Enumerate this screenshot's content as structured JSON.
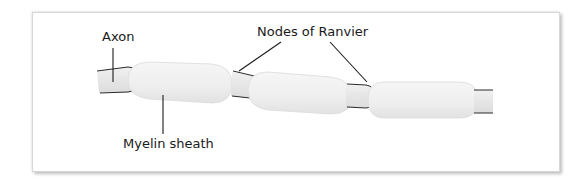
{
  "diagram": {
    "labels": {
      "axon": "Axon",
      "nodes": "Nodes of Ranvier",
      "myelin": "Myelin sheath"
    },
    "parts": [
      {
        "name": "axon",
        "description": "Axon core visible at left end, between sheaths and at right end"
      },
      {
        "name": "myelin-sheath",
        "count": 3,
        "description": "Three capsule-shaped myelin segments wrapping the axon"
      },
      {
        "name": "node-of-ranvier",
        "count": 2,
        "description": "Gaps between myelin segments exposing the axon"
      }
    ],
    "colors": {
      "frame_border": "#d6d6d6",
      "axon_fill": "#ececec",
      "sheath_fill": "#f1f1f1",
      "outline": "#2a2a2a",
      "text": "#1a1a1a"
    }
  }
}
